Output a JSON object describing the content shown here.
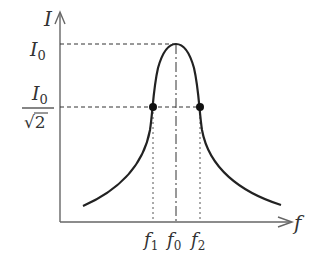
{
  "diagram": {
    "axes": {
      "y_label": "I",
      "x_label": "f"
    },
    "levels": {
      "peak": "I0",
      "half_power_num": "I0",
      "half_power_den": "√2"
    },
    "frequencies": [
      {
        "name": "f1",
        "base": "f",
        "sub": "1"
      },
      {
        "name": "f0",
        "base": "f",
        "sub": "0"
      },
      {
        "name": "f2",
        "base": "f",
        "sub": "2"
      }
    ],
    "colors": {
      "ink": "#333333",
      "axis": "#666666"
    }
  }
}
